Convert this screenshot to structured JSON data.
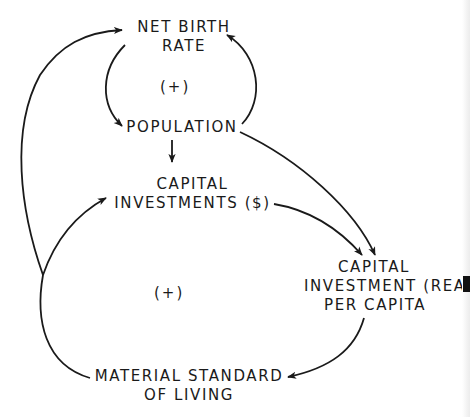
{
  "diagram": {
    "type": "causal-loop",
    "nodes": {
      "net_birth_rate": {
        "line1": "NET BIRTH",
        "line2": "RATE"
      },
      "population": {
        "line1": "POPULATION"
      },
      "capital_investments": {
        "line1": "CAPITAL",
        "line2": "INVESTMENTS ($)"
      },
      "capital_investment_per_capita": {
        "line1": "CAPITAL",
        "line2": "INVESTMENT (REA",
        "line3": "PER CAPITA"
      },
      "material_standard": {
        "line1": "MATERIAL STANDARD",
        "line2": "OF LIVING"
      }
    },
    "loop_signs": {
      "upper": "(+)",
      "lower": "(+)"
    },
    "edges": [
      {
        "from": "NET BIRTH RATE",
        "to": "POPULATION"
      },
      {
        "from": "POPULATION",
        "to": "NET BIRTH RATE"
      },
      {
        "from": "POPULATION",
        "to": "CAPITAL INVESTMENTS ($)"
      },
      {
        "from": "POPULATION",
        "to": "CAPITAL INVESTMENT (REAL) PER CAPITA"
      },
      {
        "from": "CAPITAL INVESTMENTS ($)",
        "to": "CAPITAL INVESTMENT (REAL) PER CAPITA"
      },
      {
        "from": "CAPITAL INVESTMENT (REAL) PER CAPITA",
        "to": "MATERIAL STANDARD OF LIVING"
      },
      {
        "from": "MATERIAL STANDARD OF LIVING",
        "to": "CAPITAL INVESTMENTS ($)"
      },
      {
        "from": "MATERIAL STANDARD OF LIVING",
        "to": "NET BIRTH RATE"
      }
    ],
    "colors": {
      "ink": "#1a1a1a",
      "paper": "#ffffff"
    }
  }
}
